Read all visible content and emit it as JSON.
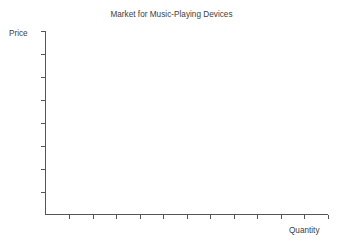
{
  "chart_data": {
    "type": "line",
    "title": "Market for Music-Playing Devices",
    "xlabel": "Quantity",
    "ylabel": "Price",
    "grid": false,
    "legend": null,
    "series": [],
    "values": [],
    "categories": [],
    "annotations": [],
    "x_tick_labels": [],
    "y_tick_labels": [],
    "x_tick_count": 12,
    "y_tick_count": 8,
    "xlim": [
      0,
      12
    ],
    "ylim": [
      0,
      8
    ],
    "note": "Empty axes template: price on vertical axis, quantity on horizontal axis, no curves plotted",
    "colors": {
      "axis": "#555555",
      "text": "#3d3d3d",
      "background": "#ffffff"
    }
  },
  "figure": {
    "title": "Market for Music-Playing Devices",
    "y_axis_label": "Price",
    "x_axis_label": "Quantity"
  }
}
